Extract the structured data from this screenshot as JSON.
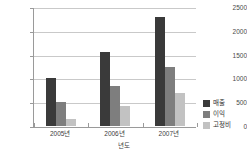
{
  "chart_data": {
    "type": "bar",
    "title": "",
    "subtitle": "",
    "xlabel": "년도",
    "ylabel": "",
    "categories": [
      "2005년",
      "2006년",
      "2007년"
    ],
    "series": [
      {
        "name": "매출",
        "color": "#3a3a3a",
        "values": [
          1000,
          1550,
          2280
        ]
      },
      {
        "name": "이익",
        "color": "#7e7e7e",
        "values": [
          500,
          850,
          1240
        ]
      },
      {
        "name": "고정비",
        "color": "#c2c2c2",
        "values": [
          150,
          420,
          700
        ]
      }
    ],
    "ylim": [
      0,
      2500
    ],
    "yticks": [
      0,
      500,
      1000,
      1500,
      2000,
      2500
    ],
    "ytick_labels": [
      "0",
      "500",
      "1000",
      "1500",
      "2000",
      "2500"
    ],
    "grid": true,
    "grid_axis": "y",
    "legend_position": "right",
    "axis_color": "#9a9a9a",
    "grid_color": "#c9c9c9",
    "background": "#ffffff"
  }
}
